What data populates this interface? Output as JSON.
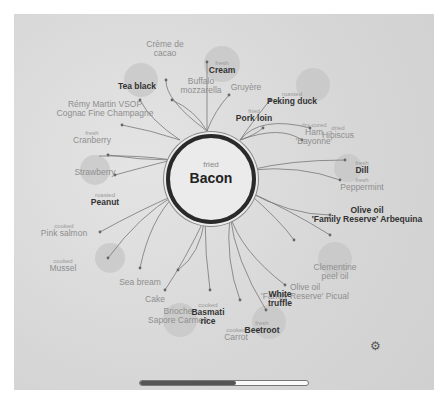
{
  "center": {
    "qualifier": "fried",
    "name": "Bacon"
  },
  "pairings": [
    {
      "id": "creme-de-cacao",
      "qualifier": "",
      "name": "Crème de\ncacao",
      "x": 165,
      "y": 40,
      "bold": false
    },
    {
      "id": "cream",
      "qualifier": "fresh",
      "name": "Cream",
      "x": 222,
      "y": 60,
      "bold": true
    },
    {
      "id": "tea-black",
      "qualifier": "",
      "name": "Tea black",
      "x": 137,
      "y": 82,
      "bold": true
    },
    {
      "id": "buffalo-mozzarella",
      "qualifier": "",
      "name": "Buffalo\nmozzarella",
      "x": 201,
      "y": 77,
      "bold": false
    },
    {
      "id": "gruyere",
      "qualifier": "",
      "name": "Gruyère",
      "x": 246,
      "y": 83,
      "bold": false
    },
    {
      "id": "peking-duck",
      "qualifier": "roasted",
      "name": "Peking duck",
      "x": 292,
      "y": 91,
      "bold": true
    },
    {
      "id": "remy-martin",
      "qualifier": "",
      "name": "Rémy Martin VSOP\nCognac Fine Champagne",
      "x": 105,
      "y": 100,
      "bold": false
    },
    {
      "id": "pork-loin",
      "qualifier": "fried",
      "name": "Pork loin",
      "x": 254,
      "y": 108,
      "bold": true
    },
    {
      "id": "ham-bayonne",
      "qualifier": "dry-cured",
      "name": "Ham\n'Bayonne'",
      "x": 314,
      "y": 122,
      "bold": false
    },
    {
      "id": "hibiscus",
      "qualifier": "dried",
      "name": "Hibiscus",
      "x": 338,
      "y": 125,
      "bold": false
    },
    {
      "id": "cranberry",
      "qualifier": "fresh",
      "name": "Cranberry",
      "x": 92,
      "y": 130,
      "bold": false
    },
    {
      "id": "dill",
      "qualifier": "fresh",
      "name": "Dill",
      "x": 362,
      "y": 160,
      "bold": true
    },
    {
      "id": "strawberry",
      "qualifier": "",
      "name": "Strawberry",
      "x": 95,
      "y": 168,
      "bold": false
    },
    {
      "id": "peppermint",
      "qualifier": "fresh",
      "name": "Peppermint",
      "x": 362,
      "y": 177,
      "bold": false
    },
    {
      "id": "peanut",
      "qualifier": "roasted",
      "name": "Peanut",
      "x": 105,
      "y": 192,
      "bold": true
    },
    {
      "id": "olive-oil-arbequina",
      "qualifier": "",
      "name": "Olive oil\n'Family Reserve' Arbequina",
      "x": 367,
      "y": 206,
      "bold": true
    },
    {
      "id": "pink-salmon",
      "qualifier": "cooked",
      "name": "Pink salmon",
      "x": 64,
      "y": 223,
      "bold": false
    },
    {
      "id": "mussel",
      "qualifier": "cooked",
      "name": "Mussel",
      "x": 63,
      "y": 258,
      "bold": false
    },
    {
      "id": "clementine-peel-oil",
      "qualifier": "",
      "name": "Clementine\npeel oil",
      "x": 335,
      "y": 263,
      "bold": false
    },
    {
      "id": "sea-bream",
      "qualifier": "",
      "name": "Sea bream",
      "x": 140,
      "y": 278,
      "bold": false
    },
    {
      "id": "olive-oil-picual",
      "qualifier": "",
      "name": "Olive oil\n'Family Reserve' Picual",
      "x": 305,
      "y": 283,
      "bold": false
    },
    {
      "id": "cake",
      "qualifier": "",
      "name": "Cake",
      "x": 155,
      "y": 295,
      "bold": false
    },
    {
      "id": "white-truffle",
      "qualifier": "",
      "name": "White\ntruffle",
      "x": 280,
      "y": 290,
      "bold": true
    },
    {
      "id": "brioche",
      "qualifier": "",
      "name": "Brioche\nSapore Carmen",
      "x": 178,
      "y": 307,
      "bold": false
    },
    {
      "id": "basmati-rice",
      "qualifier": "cooked",
      "name": "Basmati\nrice",
      "x": 208,
      "y": 302,
      "bold": true
    },
    {
      "id": "carrot",
      "qualifier": "cooked",
      "name": "Carrot",
      "x": 236,
      "y": 327,
      "bold": false
    },
    {
      "id": "beetroot",
      "qualifier": "fresh",
      "name": "Beetroot",
      "x": 262,
      "y": 320,
      "bold": true
    }
  ],
  "scrollbar": {
    "progress_percent": 57
  },
  "settings": {
    "icon": "gear-icon"
  }
}
